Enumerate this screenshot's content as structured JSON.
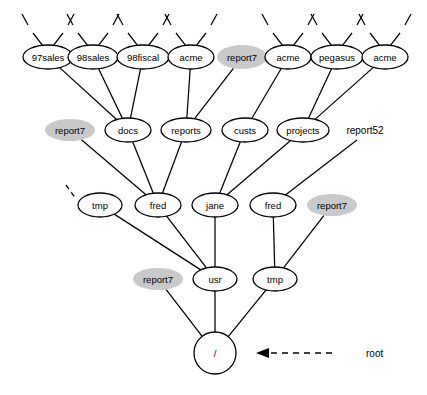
{
  "diagram": {
    "root_annotation": {
      "label": "root",
      "arrow": "dashed-left-arrow"
    },
    "colors": {
      "shaded_node_fill": "#c9c9c9",
      "node_fill": "#ffffff",
      "stroke": "#000000",
      "background": "#ffffff"
    },
    "nodes": [
      {
        "id": "n_97sales",
        "label": "97sales",
        "shape": "ellipse",
        "shaded": false,
        "cx": 48,
        "cy": 57,
        "rx": 25,
        "ry": 12,
        "stubs": [
          -1,
          1
        ]
      },
      {
        "id": "n_98sales",
        "label": "98sales",
        "shape": "ellipse",
        "shaded": false,
        "cx": 93,
        "cy": 57,
        "rx": 25,
        "ry": 12,
        "stubs": [
          -1,
          1
        ]
      },
      {
        "id": "n_98fiscal",
        "label": "98fiscal",
        "shape": "ellipse",
        "shaded": false,
        "cx": 143,
        "cy": 57,
        "rx": 26,
        "ry": 12,
        "stubs": [
          -1,
          1
        ]
      },
      {
        "id": "n_acme1",
        "label": "acme",
        "shape": "ellipse",
        "shaded": false,
        "cx": 191,
        "cy": 57,
        "rx": 23,
        "ry": 12,
        "stubs": [
          -1,
          1
        ]
      },
      {
        "id": "n_report7_t",
        "label": "report7",
        "shape": "ellipse",
        "shaded": true,
        "cx": 242,
        "cy": 57,
        "rx": 25,
        "ry": 12,
        "stubs": []
      },
      {
        "id": "n_acme2",
        "label": "acme",
        "shape": "ellipse",
        "shaded": false,
        "cx": 288,
        "cy": 57,
        "rx": 23,
        "ry": 12,
        "stubs": [
          -1,
          1
        ]
      },
      {
        "id": "n_pegasus",
        "label": "pegasus",
        "shape": "ellipse",
        "shaded": false,
        "cx": 337,
        "cy": 57,
        "rx": 26,
        "ry": 12,
        "stubs": [
          -1,
          1
        ]
      },
      {
        "id": "n_acme3",
        "label": "acme",
        "shape": "ellipse",
        "shaded": false,
        "cx": 385,
        "cy": 57,
        "rx": 23,
        "ry": 12,
        "stubs": [
          -1,
          1
        ]
      },
      {
        "id": "n_report7_r2",
        "label": "report7",
        "shape": "ellipse",
        "shaded": true,
        "cx": 70,
        "cy": 130,
        "rx": 25,
        "ry": 11,
        "stubs": []
      },
      {
        "id": "n_docs",
        "label": "docs",
        "shape": "ellipse",
        "shaded": false,
        "cx": 128,
        "cy": 130,
        "rx": 23,
        "ry": 12,
        "stubs": []
      },
      {
        "id": "n_reports",
        "label": "reports",
        "shape": "ellipse",
        "shaded": false,
        "cx": 186,
        "cy": 130,
        "rx": 25,
        "ry": 12,
        "stubs": []
      },
      {
        "id": "n_custs",
        "label": "custs",
        "shape": "ellipse",
        "shaded": false,
        "cx": 245,
        "cy": 130,
        "rx": 23,
        "ry": 12,
        "stubs": []
      },
      {
        "id": "n_projects",
        "label": "projects",
        "shape": "ellipse",
        "shaded": false,
        "cx": 303,
        "cy": 130,
        "rx": 26,
        "ry": 12,
        "stubs": []
      },
      {
        "id": "n_report52",
        "label": "report52",
        "shape": "plain",
        "shaded": false,
        "cx": 365,
        "cy": 130,
        "rx": 26,
        "ry": 10,
        "stubs": []
      },
      {
        "id": "n_tmp1",
        "label": "tmp",
        "shape": "ellipse",
        "shaded": false,
        "cx": 100,
        "cy": 205,
        "rx": 22,
        "ry": 12,
        "stubs": []
      },
      {
        "id": "n_fred1",
        "label": "fred",
        "shape": "ellipse",
        "shaded": false,
        "cx": 158,
        "cy": 205,
        "rx": 23,
        "ry": 12,
        "stubs": []
      },
      {
        "id": "n_jane",
        "label": "jane",
        "shape": "ellipse",
        "shaded": false,
        "cx": 215,
        "cy": 205,
        "rx": 23,
        "ry": 12,
        "stubs": []
      },
      {
        "id": "n_fred2",
        "label": "fred",
        "shape": "ellipse",
        "shaded": false,
        "cx": 273,
        "cy": 205,
        "rx": 23,
        "ry": 12,
        "stubs": []
      },
      {
        "id": "n_report7_r3",
        "label": "report7",
        "shape": "ellipse",
        "shaded": true,
        "cx": 332,
        "cy": 205,
        "rx": 25,
        "ry": 11,
        "stubs": []
      },
      {
        "id": "n_report7_r4",
        "label": "report7",
        "shape": "ellipse",
        "shaded": true,
        "cx": 158,
        "cy": 279,
        "rx": 25,
        "ry": 11,
        "stubs": []
      },
      {
        "id": "n_usr",
        "label": "usr",
        "shape": "ellipse",
        "shaded": false,
        "cx": 215,
        "cy": 279,
        "rx": 22,
        "ry": 12,
        "stubs": []
      },
      {
        "id": "n_tmp2",
        "label": "tmp",
        "shape": "ellipse",
        "shaded": false,
        "cx": 275,
        "cy": 279,
        "rx": 22,
        "ry": 12,
        "stubs": []
      },
      {
        "id": "n_root",
        "label": "/",
        "shape": "circle",
        "shaded": false,
        "cx": 215,
        "cy": 353,
        "rx": 21,
        "ry": 21,
        "stubs": []
      }
    ],
    "edges": [
      {
        "from": "n_97sales",
        "to": "n_docs"
      },
      {
        "from": "n_98sales",
        "to": "n_docs"
      },
      {
        "from": "n_98fiscal",
        "to": "n_docs"
      },
      {
        "from": "n_acme1",
        "to": "n_reports"
      },
      {
        "from": "n_report7_t",
        "to": "n_reports"
      },
      {
        "from": "n_acme2",
        "to": "n_custs"
      },
      {
        "from": "n_pegasus",
        "to": "n_projects"
      },
      {
        "from": "n_acme3",
        "to": "n_projects"
      },
      {
        "from": "n_report7_r2",
        "to": "n_fred1"
      },
      {
        "from": "n_docs",
        "to": "n_fred1"
      },
      {
        "from": "n_reports",
        "to": "n_fred1"
      },
      {
        "from": "n_custs",
        "to": "n_jane"
      },
      {
        "from": "n_projects",
        "to": "n_jane"
      },
      {
        "from": "n_report52",
        "to": "n_fred2"
      },
      {
        "from": "n_tmp1",
        "to": "n_usr"
      },
      {
        "from": "n_fred1",
        "to": "n_usr"
      },
      {
        "from": "n_jane",
        "to": "n_usr"
      },
      {
        "from": "n_fred2",
        "to": "n_tmp2"
      },
      {
        "from": "n_report7_r3",
        "to": "n_tmp2"
      },
      {
        "from": "n_report7_r4",
        "to": "n_root"
      },
      {
        "from": "n_usr",
        "to": "n_root"
      },
      {
        "from": "n_tmp2",
        "to": "n_root"
      }
    ],
    "detached_stubs": [
      {
        "id": "stub_tmp1",
        "x1": 66,
        "y1": 185,
        "x2": 76,
        "y2": 199,
        "dashed": true
      }
    ]
  }
}
